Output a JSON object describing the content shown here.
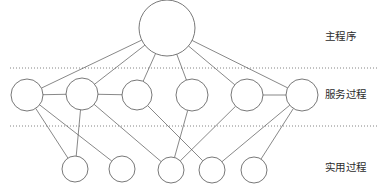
{
  "figure": {
    "width": 389,
    "height": 194,
    "background_color": "#ffffff",
    "stroke_color": "#555555",
    "label_color": "#2b2b2b"
  },
  "top_sliver": {
    "text": "",
    "note": "faint cropped sliver of a preceding text line at the very top edge"
  },
  "tiers": [
    {
      "id": "main-program",
      "label": "主程序",
      "node_count": 1,
      "node_radius": 28,
      "center_y": 28
    },
    {
      "id": "service-process",
      "label": "服务过程",
      "node_count": 6,
      "node_radius": 16,
      "center_y": 95
    },
    {
      "id": "utility-process",
      "label": "实用过程",
      "node_count": 5,
      "node_radius": 13,
      "center_y": 170
    }
  ],
  "dividers": [
    {
      "id": "divider-top",
      "y": 68,
      "x1": 10,
      "x2": 378,
      "style": "dotted"
    },
    {
      "id": "divider-bottom",
      "y": 126,
      "x1": 10,
      "x2": 378,
      "style": "dotted"
    }
  ],
  "nodes": [
    {
      "id": "M0",
      "tier": 0,
      "cx": 167,
      "cy": 28,
      "r": 28
    },
    {
      "id": "S0",
      "tier": 1,
      "cx": 27,
      "cy": 95,
      "r": 16
    },
    {
      "id": "S1",
      "tier": 1,
      "cx": 82,
      "cy": 94,
      "r": 16
    },
    {
      "id": "S2",
      "tier": 1,
      "cx": 137,
      "cy": 95,
      "r": 15
    },
    {
      "id": "S3",
      "tier": 1,
      "cx": 192,
      "cy": 95,
      "r": 16
    },
    {
      "id": "S4",
      "tier": 1,
      "cx": 247,
      "cy": 95,
      "r": 16
    },
    {
      "id": "S5",
      "tier": 1,
      "cx": 302,
      "cy": 95,
      "r": 16
    },
    {
      "id": "U0",
      "tier": 2,
      "cx": 75,
      "cy": 169,
      "r": 13
    },
    {
      "id": "U1",
      "tier": 2,
      "cx": 122,
      "cy": 169,
      "r": 13
    },
    {
      "id": "U2",
      "tier": 2,
      "cx": 171,
      "cy": 170,
      "r": 13
    },
    {
      "id": "U3",
      "tier": 2,
      "cx": 212,
      "cy": 170,
      "r": 13
    },
    {
      "id": "U4",
      "tier": 2,
      "cx": 254,
      "cy": 170,
      "r": 13
    }
  ],
  "edges": [
    {
      "from": "M0",
      "to": "S0"
    },
    {
      "from": "M0",
      "to": "S1"
    },
    {
      "from": "M0",
      "to": "S2"
    },
    {
      "from": "M0",
      "to": "S3"
    },
    {
      "from": "M0",
      "to": "S4"
    },
    {
      "from": "M0",
      "to": "S5"
    },
    {
      "from": "S0",
      "to": "U0"
    },
    {
      "from": "S0",
      "to": "U1"
    },
    {
      "from": "S1",
      "to": "U0"
    },
    {
      "from": "S1",
      "to": "U2"
    },
    {
      "from": "S2",
      "to": "U3"
    },
    {
      "from": "S3",
      "to": "U2"
    },
    {
      "from": "S4",
      "to": "U2"
    },
    {
      "from": "S5",
      "to": "U3"
    },
    {
      "from": "S5",
      "to": "U4"
    },
    {
      "from": "S0",
      "to": "S1"
    },
    {
      "from": "S1",
      "to": "S2"
    },
    {
      "from": "S4",
      "to": "S5"
    }
  ]
}
